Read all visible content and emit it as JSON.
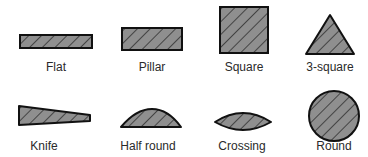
{
  "colors": {
    "fill": "#8f8f8f",
    "stroke": "#111111",
    "hatch": "#1a1a1a",
    "text": "#2a2a2a"
  },
  "shapes": [
    {
      "id": "flat",
      "label": "Flat",
      "icon": "flat-rectangle-icon"
    },
    {
      "id": "pillar",
      "label": "Pillar",
      "icon": "pillar-rectangle-icon"
    },
    {
      "id": "square",
      "label": "Square",
      "icon": "square-icon"
    },
    {
      "id": "three-square",
      "label": "3-square",
      "icon": "triangle-icon"
    },
    {
      "id": "knife",
      "label": "Knife",
      "icon": "knife-wedge-icon"
    },
    {
      "id": "half-round",
      "label": "Half round",
      "icon": "half-round-icon"
    },
    {
      "id": "crossing",
      "label": "Crossing",
      "icon": "crossing-lens-icon"
    },
    {
      "id": "round",
      "label": "Round",
      "icon": "round-circle-icon"
    }
  ]
}
